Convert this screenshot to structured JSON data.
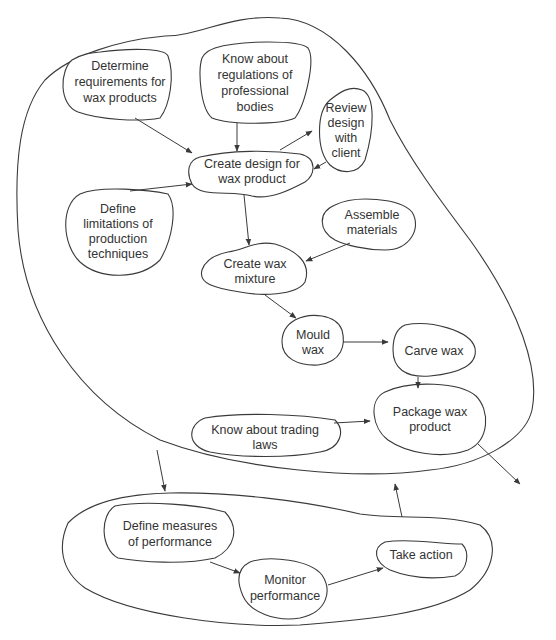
{
  "diagram": {
    "type": "process-map",
    "colors": {
      "line": "#3a3a3a",
      "text": "#333333",
      "background": "#ffffff"
    },
    "groups": [
      {
        "id": "production",
        "label": ""
      },
      {
        "id": "performance",
        "label": ""
      }
    ],
    "nodes": {
      "determine_requirements": {
        "lines": [
          "Determine",
          "requirements for",
          "wax products"
        ]
      },
      "know_regulations": {
        "lines": [
          "Know about",
          "regulations of",
          "professional",
          "bodies"
        ]
      },
      "review_design": {
        "lines": [
          "Review",
          "design",
          "with",
          "client"
        ]
      },
      "create_design": {
        "lines": [
          "Create design for",
          "wax product"
        ]
      },
      "define_limitations": {
        "lines": [
          "Define",
          "limitations of",
          "production",
          "techniques"
        ]
      },
      "assemble_materials": {
        "lines": [
          "Assemble",
          "materials"
        ]
      },
      "create_mixture": {
        "lines": [
          "Create wax",
          "mixture"
        ]
      },
      "mould_wax": {
        "lines": [
          "Mould",
          "wax"
        ]
      },
      "carve_wax": {
        "lines": [
          "Carve wax"
        ]
      },
      "trading_laws": {
        "lines": [
          "Know about trading",
          "laws"
        ]
      },
      "package_product": {
        "lines": [
          "Package wax",
          "product"
        ]
      },
      "define_measures": {
        "lines": [
          "Define measures",
          "of performance"
        ]
      },
      "monitor_performance": {
        "lines": [
          "Monitor",
          "performance"
        ]
      },
      "take_action": {
        "lines": [
          "Take action"
        ]
      }
    },
    "edges": [
      {
        "from": "determine_requirements",
        "to": "create_design"
      },
      {
        "from": "know_regulations",
        "to": "create_design"
      },
      {
        "from": "create_design",
        "to": "review_design"
      },
      {
        "from": "review_design",
        "to": "create_design"
      },
      {
        "from": "define_limitations",
        "to": "create_design"
      },
      {
        "from": "create_design",
        "to": "create_mixture"
      },
      {
        "from": "assemble_materials",
        "to": "create_mixture"
      },
      {
        "from": "create_mixture",
        "to": "mould_wax"
      },
      {
        "from": "mould_wax",
        "to": "carve_wax"
      },
      {
        "from": "carve_wax",
        "to": "package_product"
      },
      {
        "from": "trading_laws",
        "to": "package_product"
      },
      {
        "from": "package_product",
        "to": "outside"
      },
      {
        "from": "production",
        "to": "performance"
      },
      {
        "from": "performance",
        "to": "production"
      },
      {
        "from": "define_measures",
        "to": "monitor_performance"
      },
      {
        "from": "monitor_performance",
        "to": "take_action"
      }
    ]
  }
}
